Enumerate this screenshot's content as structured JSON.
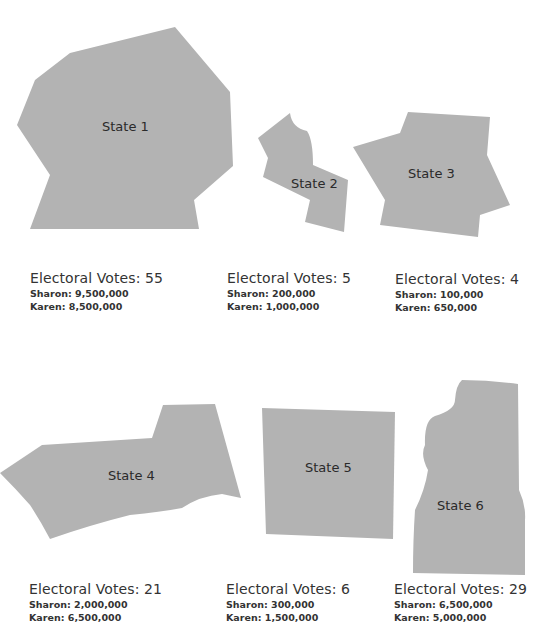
{
  "states": [
    {
      "name": "State 1",
      "electoral_votes_label": "Electoral Votes: 55",
      "sharon": "Sharon: 9,500,000",
      "karen": "Karen: 8,500,000"
    },
    {
      "name": "State 2",
      "electoral_votes_label": "Electoral Votes: 5",
      "sharon": "Sharon: 200,000",
      "karen": "Karen: 1,000,000"
    },
    {
      "name": "State 3",
      "electoral_votes_label": "Electoral Votes: 4",
      "sharon": "Sharon: 100,000",
      "karen": "Karen: 650,000"
    },
    {
      "name": "State 4",
      "electoral_votes_label": "Electoral Votes: 21",
      "sharon": "Sharon: 2,000,000",
      "karen": "Karen: 6,500,000"
    },
    {
      "name": "State 5",
      "electoral_votes_label": "Electoral Votes: 6",
      "sharon": "Sharon: 300,000",
      "karen": "Karen: 1,500,000"
    },
    {
      "name": "State 6",
      "electoral_votes_label": "Electoral Votes: 29",
      "sharon": "Sharon: 6,500,000",
      "karen": "Karen: 5,000,000"
    }
  ],
  "colors": {
    "shape_fill": "#b3b3b3",
    "text": "#333333"
  }
}
